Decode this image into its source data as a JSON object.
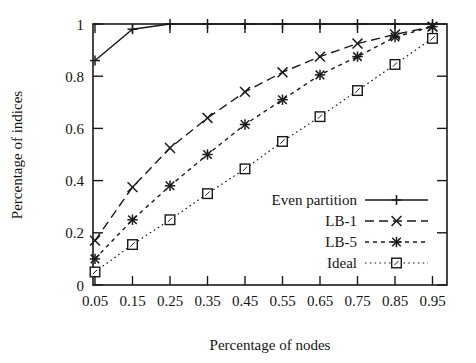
{
  "chart_data": {
    "type": "line",
    "title": "",
    "xlabel": "Percentage of nodes",
    "ylabel": "Percentage of indices",
    "x": [
      0.05,
      0.15,
      0.25,
      0.35,
      0.45,
      0.55,
      0.65,
      0.75,
      0.85,
      0.95
    ],
    "xtick_labels": [
      "0.05",
      "0.15",
      "0.25",
      "0.35",
      "0.45",
      "0.55",
      "0.65",
      "0.75",
      "0.85",
      "0.95"
    ],
    "ytick_labels": [
      "0",
      "0.2",
      "0.4",
      "0.6",
      "0.8",
      "1"
    ],
    "ytick_values": [
      0,
      0.2,
      0.4,
      0.6,
      0.8,
      1
    ],
    "xlim": [
      0.0,
      1.0
    ],
    "ylim": [
      0,
      1
    ],
    "grid": false,
    "legend_position": "lower right",
    "series": [
      {
        "name": "Even partition",
        "marker": "plus",
        "dash": "solid",
        "values": [
          0.86,
          0.98,
          1.0,
          1.0,
          1.0,
          1.0,
          1.0,
          1.0,
          1.0,
          1.0
        ]
      },
      {
        "name": "LB-1",
        "marker": "cross",
        "dash": "dashed",
        "values": [
          0.17,
          0.375,
          0.525,
          0.64,
          0.74,
          0.815,
          0.875,
          0.925,
          0.96,
          0.99
        ]
      },
      {
        "name": "LB-5",
        "marker": "star",
        "dash": "dotted",
        "values": [
          0.1,
          0.25,
          0.38,
          0.5,
          0.615,
          0.71,
          0.805,
          0.875,
          0.95,
          0.99
        ]
      },
      {
        "name": "Ideal",
        "marker": "square",
        "dash": "fine-dotted",
        "values": [
          0.05,
          0.155,
          0.25,
          0.35,
          0.445,
          0.55,
          0.645,
          0.745,
          0.845,
          0.945
        ]
      }
    ]
  },
  "axes": {
    "x_title": "Percentage of nodes",
    "y_title": "Percentage of indices"
  },
  "legend": {
    "entries": [
      {
        "label": "Even partition"
      },
      {
        "label": "LB-1"
      },
      {
        "label": "LB-5"
      },
      {
        "label": "Ideal"
      }
    ]
  },
  "colors": {
    "ink": "#1a1a1a",
    "background": "#ffffff"
  }
}
